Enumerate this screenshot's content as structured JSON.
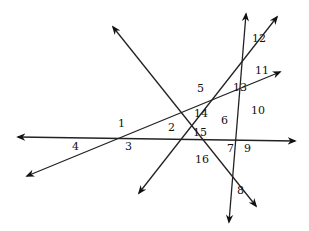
{
  "diagram": {
    "stroke_color": "#222222",
    "lines": [
      {
        "id": "horizontal",
        "x1": 18,
        "y1": 137,
        "x2": 295,
        "y2": 141,
        "arrows": "both"
      },
      {
        "id": "shallow-diagonal",
        "x1": 27,
        "y1": 176,
        "x2": 280,
        "y2": 72,
        "arrows": "both"
      },
      {
        "id": "steep-rising",
        "x1": 139,
        "y1": 193,
        "x2": 277,
        "y2": 17,
        "arrows": "both"
      },
      {
        "id": "near-vertical",
        "x1": 246,
        "y1": 14,
        "x2": 229,
        "y2": 222,
        "arrows": "both"
      },
      {
        "id": "descending",
        "x1": 113,
        "y1": 27,
        "x2": 256,
        "y2": 206,
        "arrows": "both"
      }
    ],
    "labels": [
      {
        "text": "1",
        "x": 118,
        "y": 127
      },
      {
        "text": "2",
        "x": 168,
        "y": 131
      },
      {
        "text": "3",
        "x": 125,
        "y": 150
      },
      {
        "text": "4",
        "x": 72,
        "y": 150
      },
      {
        "text": "5",
        "x": 197,
        "y": 92
      },
      {
        "text": "6",
        "x": 221,
        "y": 124
      },
      {
        "text": "7",
        "x": 227,
        "y": 152
      },
      {
        "text": "8",
        "x": 237,
        "y": 194
      },
      {
        "text": "9",
        "x": 244,
        "y": 152
      },
      {
        "text": "10",
        "x": 251,
        "y": 114
      },
      {
        "text": "11",
        "x": 255,
        "y": 74
      },
      {
        "text": "12",
        "x": 252,
        "y": 42
      },
      {
        "text": "13",
        "x": 233,
        "y": 91
      },
      {
        "text": "14",
        "x": 194,
        "y": 117
      },
      {
        "text": "15",
        "x": 193,
        "y": 136
      },
      {
        "text": "16",
        "x": 195,
        "y": 163
      }
    ]
  }
}
